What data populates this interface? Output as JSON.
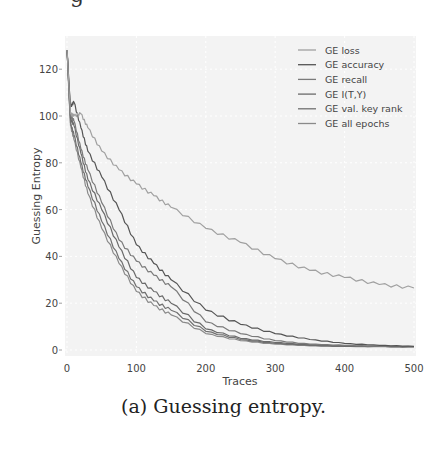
{
  "figure": {
    "caption": "(a) Guessing entropy.",
    "top_fragment": "g"
  },
  "chart_data": {
    "type": "line",
    "title": "",
    "xlabel": "Traces",
    "ylabel": "Guessing Entropy",
    "xlim": [
      0,
      500
    ],
    "ylim": [
      -5,
      130
    ],
    "xticks": [
      0,
      100,
      200,
      300,
      400,
      500
    ],
    "yticks": [
      0,
      20,
      40,
      60,
      80,
      100,
      120
    ],
    "grid": true,
    "legend_position": "upper right",
    "x": [
      0,
      5,
      10,
      20,
      30,
      50,
      75,
      100,
      125,
      150,
      200,
      250,
      300,
      350,
      400,
      450,
      500
    ],
    "series": [
      {
        "name": "GE loss",
        "color": "#a0a0a0",
        "values": [
          128,
          101,
          100,
          101,
          95,
          85,
          77,
          71,
          66,
          61,
          52,
          46,
          39,
          34,
          31,
          28,
          26.5
        ]
      },
      {
        "name": "GE accuracy",
        "color": "#555555",
        "values": [
          128,
          104,
          106,
          95,
          85,
          74,
          60,
          45,
          37,
          30,
          17,
          11,
          7,
          4.5,
          2.8,
          2,
          1.6
        ]
      },
      {
        "name": "GE recall",
        "color": "#7a7a7a",
        "values": [
          128,
          100,
          98,
          86,
          77,
          63,
          47,
          38,
          32,
          27,
          12,
          7,
          4,
          2.5,
          2,
          1.6,
          1.5
        ]
      },
      {
        "name": "GE I(T,Y)",
        "color": "#6a6a6a",
        "values": [
          128,
          99,
          96,
          84,
          73,
          60,
          44,
          31,
          25,
          20,
          9,
          5,
          3.2,
          2.2,
          1.7,
          1.5,
          1.4
        ]
      },
      {
        "name": "GE val. key rank",
        "color": "#707070",
        "values": [
          128,
          97,
          92,
          80,
          70,
          55,
          39,
          27,
          21,
          17,
          8,
          4.5,
          2.8,
          2,
          1.6,
          1.5,
          1.4
        ]
      },
      {
        "name": "GE all epochs",
        "color": "#8a8a8a",
        "values": [
          128,
          96,
          90,
          78,
          67,
          52,
          37,
          25,
          19,
          15,
          7,
          4,
          2.5,
          1.8,
          1.5,
          1.4,
          1.3
        ]
      }
    ]
  }
}
